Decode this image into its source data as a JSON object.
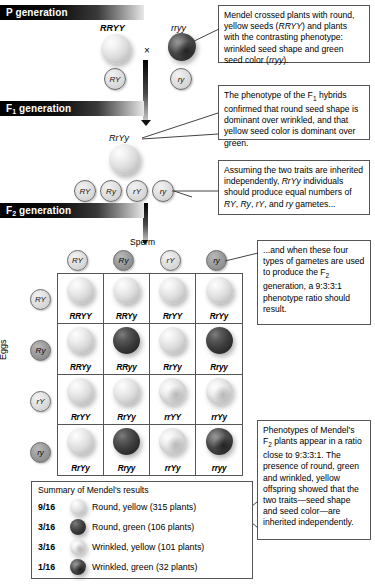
{
  "banners": [
    {
      "label": "P generation",
      "sub": ""
    },
    {
      "label": "F",
      "sub": "1",
      "suffix": " generation"
    },
    {
      "label": "F",
      "sub": "2",
      "suffix": " generation"
    }
  ],
  "p_generation": {
    "parent1_genotype": "RRYY",
    "parent1_gamete": "RY",
    "cross_symbol": "×",
    "parent2_genotype": "rryy",
    "parent2_gamete": "ry"
  },
  "f1_generation": {
    "genotype": "RrYy",
    "gametes": [
      "RY",
      "Ry",
      "rY",
      "ry"
    ]
  },
  "f2_generation": {
    "sperm_label": "Sperm",
    "eggs_label": "Eggs",
    "sperm_gametes": [
      "RY",
      "Ry",
      "rY",
      "ry"
    ],
    "egg_gametes": [
      "RY",
      "Ry",
      "rY",
      "ry"
    ],
    "grid": [
      [
        {
          "genotype": "RRYY",
          "seed": "round-yellow"
        },
        {
          "genotype": "RRYy",
          "seed": "round-yellow"
        },
        {
          "genotype": "RrYY",
          "seed": "round-yellow"
        },
        {
          "genotype": "RrYy",
          "seed": "round-yellow"
        }
      ],
      [
        {
          "genotype": "RRYy",
          "seed": "round-yellow"
        },
        {
          "genotype": "RRyy",
          "seed": "round-green"
        },
        {
          "genotype": "RrYy",
          "seed": "round-yellow"
        },
        {
          "genotype": "Rryy",
          "seed": "round-green"
        }
      ],
      [
        {
          "genotype": "RrYY",
          "seed": "round-yellow"
        },
        {
          "genotype": "RrYy",
          "seed": "round-yellow"
        },
        {
          "genotype": "rrYY",
          "seed": "wrinkled-yellow"
        },
        {
          "genotype": "rrYy",
          "seed": "wrinkled-yellow"
        }
      ],
      [
        {
          "genotype": "RrYy",
          "seed": "round-yellow"
        },
        {
          "genotype": "Rryy",
          "seed": "round-green"
        },
        {
          "genotype": "rrYy",
          "seed": "wrinkled-yellow"
        },
        {
          "genotype": "rryy",
          "seed": "wrinkled-green"
        }
      ]
    ]
  },
  "callouts": {
    "box1": "Mendel crossed plants with round, yellow seeds (RRYY) and plants with the contrasting phenotype: wrinkled seed shape and green seed color (rryy).",
    "box2": "The phenotype of the F₁ hybrids confirmed that round seed shape is dominant over wrinkled, and that yellow seed color is dominant over green.",
    "box3": "Assuming the two traits are inherited independently, RrYy individuals should produce equal numbers of RY, Ry, rY, and ry gametes...",
    "box4": "...and when these four types of gametes are used to produce the F₂ generation, a 9:3:3:1 phenotype ratio should result.",
    "box5": "Phenotypes of Mendel's F₂ plants appear in a ratio close to 9:3:3:1. The presence of round, green and wrinkled, yellow offspring showed that the two traits—seed shape and seed color—are inherited independently."
  },
  "summary": {
    "title": "Summary of Mendel's results",
    "rows": [
      {
        "fraction": "9/16",
        "seed": "round-yellow",
        "description": "Round, yellow (315 plants)"
      },
      {
        "fraction": "3/16",
        "seed": "round-green",
        "description": "Round, green (106 plants)"
      },
      {
        "fraction": "3/16",
        "seed": "wrinkled-yellow",
        "description": "Wrinkled, yellow (101 plants)"
      },
      {
        "fraction": "1/16",
        "seed": "wrinkled-green",
        "description": "Wrinkled, green (32 plants)"
      }
    ]
  }
}
